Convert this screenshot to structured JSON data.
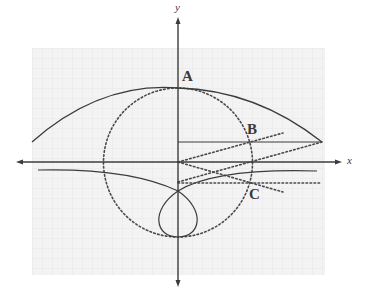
{
  "figure": {
    "background_grid": {
      "x": 32,
      "y": 48,
      "width": 293,
      "height": 227,
      "spacing": 10,
      "fill": "#f2f2f2",
      "line": "#e2e2e2"
    },
    "axes": {
      "x_label": "x",
      "y_label": "y",
      "origin": [
        178,
        162
      ],
      "x_range_px": [
        18,
        340
      ],
      "y_range_px": [
        18,
        285
      ],
      "color": "#3c3c3c"
    },
    "points": [
      {
        "label": "A",
        "x": 183,
        "y": 70
      },
      {
        "label": "B",
        "x": 246,
        "y": 122
      },
      {
        "label": "C",
        "x": 248,
        "y": 186
      }
    ],
    "curves": {
      "top_arc": "solid",
      "dotted_circle": {
        "cx": 178,
        "cy": 162.5,
        "r": 74.5
      },
      "lower_curve_with_loop": "solid"
    },
    "colors": {
      "ink": "#3c3c3c",
      "dots": "#4a4a4a"
    }
  }
}
